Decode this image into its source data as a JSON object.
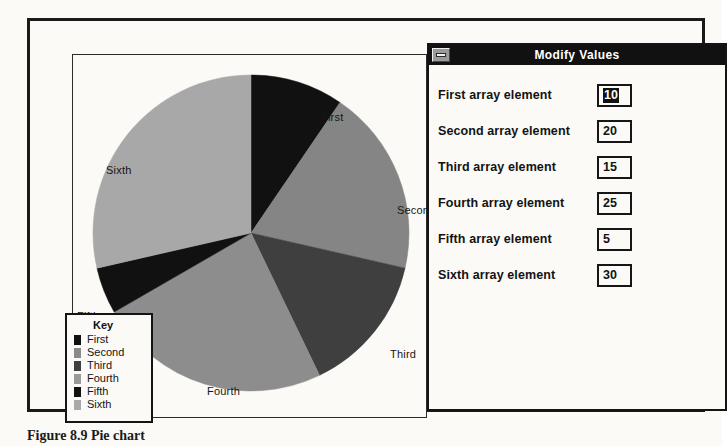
{
  "figure": {
    "caption": "Figure 8.9   Pie chart"
  },
  "chart_data": {
    "type": "pie",
    "title": "",
    "categories": [
      "First",
      "Second",
      "Third",
      "Fourth",
      "Fifth",
      "Sixth"
    ],
    "values": [
      10,
      20,
      15,
      25,
      5,
      30
    ],
    "total": 105,
    "start_angle_deg": 0,
    "direction": "clockwise",
    "colors": [
      "#111111",
      "#858585",
      "#3f3f3f",
      "#8d8d8d",
      "#111111",
      "#a8a8a8"
    ],
    "legend_position": "bottom-left",
    "legend_title": "Key",
    "labels_outside": true
  },
  "legend": {
    "title": "Key",
    "items": [
      {
        "label": "First",
        "color": "#111111"
      },
      {
        "label": "Second",
        "color": "#8a8a8a"
      },
      {
        "label": "Third",
        "color": "#3f3f3f"
      },
      {
        "label": "Fourth",
        "color": "#9a9a9a"
      },
      {
        "label": "Fifth",
        "color": "#111111"
      },
      {
        "label": "Sixth",
        "color": "#a8a8a8"
      }
    ]
  },
  "pie_labels": [
    {
      "text": "First",
      "x": 248,
      "y": 56
    },
    {
      "text": "Second",
      "x": 324,
      "y": 149
    },
    {
      "text": "Third",
      "x": 317,
      "y": 293
    },
    {
      "text": "Fourth",
      "x": 134,
      "y": 330
    },
    {
      "text": "Fifth",
      "x": 4,
      "y": 255
    },
    {
      "text": "Sixth",
      "x": 33,
      "y": 109
    }
  ],
  "dialog": {
    "title": "Modify Values",
    "sysmenu_icon": "system-menu-box",
    "fields": [
      {
        "label": "First array element",
        "value": "10",
        "selected": true
      },
      {
        "label": "Second array element",
        "value": "20",
        "selected": false
      },
      {
        "label": "Third array element",
        "value": "15",
        "selected": false
      },
      {
        "label": "Fourth array element",
        "value": "25",
        "selected": false
      },
      {
        "label": "Fifth array element",
        "value": "5",
        "selected": false
      },
      {
        "label": "Sixth array element",
        "value": "30",
        "selected": false
      }
    ]
  }
}
